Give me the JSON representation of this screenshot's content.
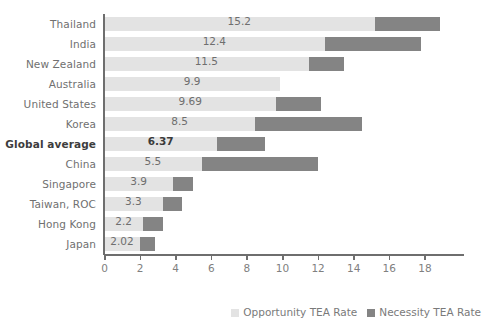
{
  "chart_data": {
    "type": "bar",
    "orientation": "horizontal",
    "stacked": true,
    "title": "",
    "xlabel": "",
    "ylabel": "",
    "xlim": [
      0,
      19.5
    ],
    "xticks": [
      0,
      2,
      4,
      6,
      8,
      10,
      12,
      14,
      16,
      18
    ],
    "xticklabels": [
      "0",
      "2",
      "4",
      "6",
      "8",
      "10",
      "12",
      "14",
      "16",
      "18"
    ],
    "grid": false,
    "legend_position": "bottom-right",
    "categories": [
      "Thailand",
      "India",
      "New Zealand",
      "Australia",
      "United States",
      "Korea",
      "Global average",
      "China",
      "Singapore",
      "Taiwan, ROC",
      "Hong Kong",
      "Japan"
    ],
    "series": [
      {
        "name": "Opportunity TEA Rate",
        "color": "#e3e3e3",
        "values": [
          15.2,
          12.4,
          11.5,
          9.9,
          9.69,
          8.5,
          6.37,
          5.5,
          3.9,
          3.3,
          2.2,
          2.02
        ]
      },
      {
        "name": "Necessity TEA Rate",
        "color": "#848484",
        "values": [
          3.7,
          5.4,
          2.0,
          0,
          2.5,
          6.0,
          2.7,
          6.5,
          1.1,
          1.1,
          1.1,
          0.85
        ]
      }
    ],
    "data_labels": [
      "15.2",
      "12.4",
      "11.5",
      "9.9",
      "9.69",
      "8.5",
      "6.37",
      "5.5",
      "3.9",
      "3.3",
      "2.2",
      "2.02"
    ],
    "highlight_category": "Global average",
    "legend": [
      {
        "label": "Opportunity TEA Rate",
        "color": "#e3e3e3",
        "swatch": "opportunity"
      },
      {
        "label": "Necessity TEA Rate",
        "color": "#848484",
        "swatch": "necessity"
      }
    ]
  }
}
